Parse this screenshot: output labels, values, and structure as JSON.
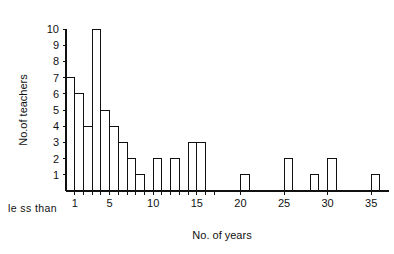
{
  "chart_data": {
    "type": "bar",
    "title": "",
    "subtitle": "",
    "xlabel": "No. of  years",
    "ylabel": "No.of teachers",
    "xlim": [
      0,
      37
    ],
    "ylim": [
      0,
      10
    ],
    "grid": false,
    "legend": null,
    "bin_width": 1,
    "x_tick_labels": [
      "1",
      "5",
      "10",
      "15",
      "20",
      "25",
      "30",
      "35"
    ],
    "x_tick_values": [
      1,
      5,
      10,
      15,
      20,
      25,
      30,
      35
    ],
    "x_minor_tick_values": [
      1,
      2,
      3,
      4,
      5,
      6,
      7,
      8,
      9,
      10,
      11,
      12,
      13,
      14,
      15,
      16,
      17
    ],
    "y_tick_labels": [
      "1",
      "2",
      "3",
      "4",
      "5",
      "6",
      "7",
      "8",
      "9",
      "10"
    ],
    "y_tick_values": [
      1,
      2,
      3,
      4,
      5,
      6,
      7,
      8,
      9,
      10
    ],
    "annotation_left": "le ss than",
    "categories": [
      "0-1",
      "1-2",
      "2-3",
      "3-4",
      "4-5",
      "5-6",
      "6-7",
      "7-8",
      "8-9",
      "9-10",
      "10-11",
      "11-12",
      "12-13",
      "13-14",
      "14-15",
      "15-16",
      "16-17",
      "17-18",
      "18-19",
      "19-20",
      "20-21",
      "21-22",
      "22-23",
      "23-24",
      "24-25",
      "25-26",
      "26-27",
      "27-28",
      "28-29",
      "29-30",
      "30-31",
      "31-32",
      "32-33",
      "33-34",
      "34-35",
      "35-36"
    ],
    "values": [
      7,
      6,
      4,
      10,
      5,
      4,
      3,
      2,
      1,
      0,
      2,
      0,
      2,
      0,
      3,
      3,
      0,
      0,
      0,
      0,
      1,
      0,
      0,
      0,
      0,
      2,
      0,
      0,
      1,
      0,
      2,
      0,
      0,
      0,
      0,
      1
    ]
  }
}
